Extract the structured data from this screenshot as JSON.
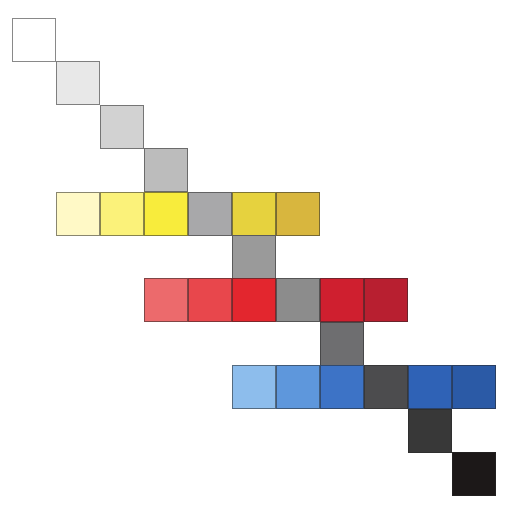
{
  "diagram": {
    "cell_size": 44,
    "origin": {
      "x": 12,
      "y": 18
    },
    "step": {
      "x": 44,
      "y": 43.4
    },
    "cells": [
      {
        "row": 0,
        "col": 0,
        "color": "#ffffff",
        "name": "gray-0-white"
      },
      {
        "row": 1,
        "col": 1,
        "color": "#e8e8e8",
        "name": "gray-1"
      },
      {
        "row": 2,
        "col": 2,
        "color": "#d2d2d2",
        "name": "gray-2"
      },
      {
        "row": 3,
        "col": 3,
        "color": "#bcbcbc",
        "name": "gray-3"
      },
      {
        "row": 4,
        "col": 1,
        "color": "#fff9c6",
        "name": "yellow-tint-1"
      },
      {
        "row": 4,
        "col": 2,
        "color": "#fbf27a",
        "name": "yellow-tint-2"
      },
      {
        "row": 4,
        "col": 3,
        "color": "#f8ec3c",
        "name": "yellow-pure"
      },
      {
        "row": 4,
        "col": 4,
        "color": "#a8a8aa",
        "name": "gray-4"
      },
      {
        "row": 4,
        "col": 5,
        "color": "#e6d23e",
        "name": "yellow-shade-1"
      },
      {
        "row": 4,
        "col": 6,
        "color": "#d8b63e",
        "name": "yellow-shade-2"
      },
      {
        "row": 5,
        "col": 5,
        "color": "#9a9a9a",
        "name": "gray-5"
      },
      {
        "row": 6,
        "col": 3,
        "color": "#ec6a6c",
        "name": "red-tint-1"
      },
      {
        "row": 6,
        "col": 4,
        "color": "#e8474c",
        "name": "red-tint-2"
      },
      {
        "row": 6,
        "col": 5,
        "color": "#e3262e",
        "name": "red-pure"
      },
      {
        "row": 6,
        "col": 6,
        "color": "#8c8c8c",
        "name": "gray-6"
      },
      {
        "row": 6,
        "col": 7,
        "color": "#cf1f2f",
        "name": "red-shade-1"
      },
      {
        "row": 6,
        "col": 8,
        "color": "#b81f30",
        "name": "red-shade-2"
      },
      {
        "row": 7,
        "col": 7,
        "color": "#6e6e70",
        "name": "gray-7"
      },
      {
        "row": 8,
        "col": 5,
        "color": "#8dbdec",
        "name": "blue-tint-1"
      },
      {
        "row": 8,
        "col": 6,
        "color": "#5e97dc",
        "name": "blue-tint-2"
      },
      {
        "row": 8,
        "col": 7,
        "color": "#3d73c6",
        "name": "blue-pure"
      },
      {
        "row": 8,
        "col": 8,
        "color": "#4c4c4e",
        "name": "gray-8"
      },
      {
        "row": 8,
        "col": 9,
        "color": "#2f62b6",
        "name": "blue-shade-1"
      },
      {
        "row": 8,
        "col": 10,
        "color": "#2b5aa6",
        "name": "blue-shade-2"
      },
      {
        "row": 9,
        "col": 9,
        "color": "#383838",
        "name": "gray-9"
      },
      {
        "row": 10,
        "col": 10,
        "color": "#1c1818",
        "name": "gray-10-black"
      }
    ]
  }
}
